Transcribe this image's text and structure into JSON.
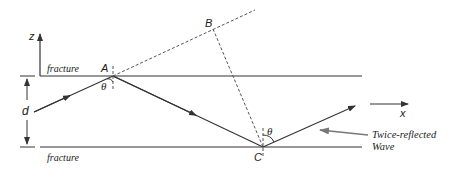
{
  "diagram": {
    "labels": {
      "z_axis": "z",
      "x_axis": "x",
      "fracture_top": "fracture",
      "fracture_bottom": "fracture",
      "thickness": "d",
      "point_a": "A",
      "point_b": "B",
      "point_c": "C",
      "angle_a": "θ",
      "angle_c": "θ",
      "annotation_line1": "Twice-reflected",
      "annotation_line2": "Wave"
    },
    "colors": {
      "line": "#333333",
      "arrow_annotation": "#666666"
    }
  }
}
